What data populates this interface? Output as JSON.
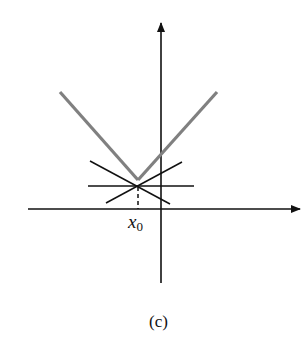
{
  "figure": {
    "caption": "(c)",
    "point_label": {
      "main": "x",
      "subscript": "0"
    },
    "colors": {
      "axis": "#111111",
      "v_curve": "#808080",
      "tangents": "#111111",
      "background": "#ffffff"
    },
    "axes": {
      "x_axis": {
        "x1": 28,
        "y1": 209,
        "x2": 300,
        "y2": 209
      },
      "y_axis": {
        "x1": 161,
        "y1": 283,
        "x2": 161,
        "y2": 23
      }
    },
    "v_curve": {
      "left": {
        "x1": 60,
        "y1": 92,
        "x2": 138,
        "y2": 180
      },
      "right": {
        "x1": 138,
        "y1": 180,
        "x2": 217,
        "y2": 92
      }
    },
    "tangent_lines": [
      {
        "name": "horizontal",
        "x1": 88,
        "y1": 186,
        "x2": 194,
        "y2": 186
      },
      {
        "name": "descending",
        "x1": 90,
        "y1": 161,
        "x2": 170,
        "y2": 204
      },
      {
        "name": "ascending",
        "x1": 106,
        "y1": 203,
        "x2": 182,
        "y2": 162
      }
    ],
    "dashed_drop": {
      "x1": 138,
      "y1": 187,
      "x2": 138,
      "y2": 209
    }
  }
}
